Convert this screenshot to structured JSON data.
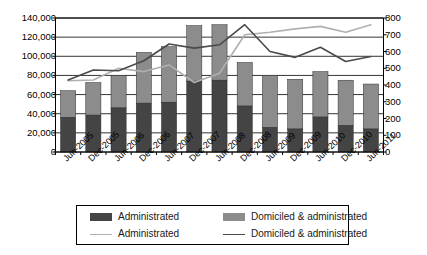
{
  "chart_data": {
    "type": "bar",
    "title": "",
    "subtitle": "",
    "xlabel": "",
    "ylabel": "",
    "categories": [
      "Jun-2005",
      "Dec-2005",
      "Jun-2006",
      "Dec-2006",
      "Jun-2007",
      "Dec-2007",
      "Jun-2008",
      "Dec-2008",
      "Jun-2009",
      "Dec-2009",
      "Jun-2010",
      "Dec-2010",
      "Jun-2011"
    ],
    "grid": true,
    "legend_position": "bottom",
    "axes": {
      "left": {
        "label": "",
        "min": 0,
        "max": 140000,
        "step": 20000,
        "ticks": [
          "0",
          "20,000",
          "40,000",
          "60,000",
          "80,000",
          "100,000",
          "120,000",
          "140,000"
        ]
      },
      "right": {
        "label": "",
        "min": 0,
        "max": 800,
        "step": 100,
        "ticks": [
          "0",
          "100",
          "200",
          "300",
          "400",
          "500",
          "600",
          "700",
          "800"
        ]
      }
    },
    "series": [
      {
        "name": "Administrated",
        "kind": "bar",
        "stack": "totals",
        "axis": "left",
        "color": "#444444",
        "values": [
          36000,
          38500,
          46000,
          51000,
          52000,
          74000,
          75000,
          48000,
          25500,
          24000,
          36500,
          27500,
          24000
        ]
      },
      {
        "name": "Domiciled & administrated",
        "kind": "bar",
        "stack": "totals",
        "axis": "left",
        "color": "#8c8c8c",
        "note": "stacked on top of Administrated; stack totals listed below",
        "values": [
          28000,
          34000,
          34000,
          53000,
          58000,
          58000,
          58000,
          45500,
          54500,
          52000,
          47500,
          47500,
          47000
        ],
        "stack_totals": [
          64000,
          72500,
          80000,
          104000,
          110000,
          132000,
          133000,
          93500,
          80000,
          76000,
          84000,
          75000,
          71000
        ]
      },
      {
        "name": "Administrated",
        "kind": "line",
        "axis": "right",
        "color": "#b0b0b0",
        "values": [
          425,
          430,
          500,
          480,
          520,
          415,
          470,
          700,
          715,
          735,
          750,
          715,
          760
        ]
      },
      {
        "name": "Domiciled & administrated",
        "kind": "line",
        "axis": "right",
        "color": "#4a4a4a",
        "values": [
          430,
          490,
          485,
          545,
          645,
          620,
          640,
          760,
          600,
          565,
          625,
          540,
          570
        ]
      }
    ]
  },
  "legend": {
    "items": [
      {
        "label": "Administrated",
        "marker": "bar-swatch-dark",
        "color": "#444444"
      },
      {
        "label": "Domiciled & administrated",
        "marker": "bar-swatch-gray",
        "color": "#8c8c8c"
      },
      {
        "label": "Administrated",
        "marker": "line-swatch-light",
        "color": "#b0b0b0"
      },
      {
        "label": "Domiciled & administrated",
        "marker": "line-swatch-dark",
        "color": "#4a4a4a"
      }
    ]
  },
  "colors": {
    "bar_dark": "#444444",
    "bar_gray": "#8c8c8c",
    "line_light": "#b0b0b0",
    "line_dark": "#4a4a4a",
    "axis": "#000000",
    "grid": "#000000",
    "background": "#ffffff"
  }
}
